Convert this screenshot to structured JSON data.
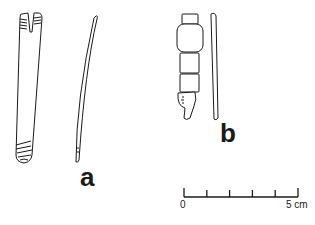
{
  "figure": {
    "labels": {
      "a": "a",
      "b": "b"
    },
    "scale_bar": {
      "start_label": "0",
      "end_label": "5 cm",
      "divisions": 5
    },
    "colors": {
      "line": "#1a1a1a",
      "background": "#ffffff"
    }
  }
}
